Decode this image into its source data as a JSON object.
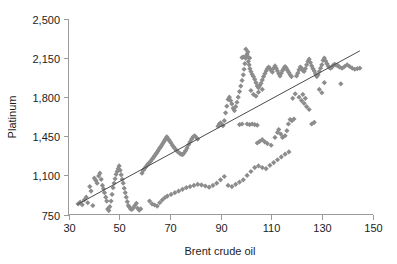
{
  "chart_data": {
    "type": "scatter",
    "title": "",
    "subtitle": "",
    "xlabel": "Brent crude oil",
    "ylabel": "Platinum",
    "xlim": [
      30,
      150
    ],
    "ylim": [
      750,
      2500
    ],
    "xticks": [
      30,
      50,
      70,
      90,
      110,
      130,
      150
    ],
    "xtick_labels": [
      "30",
      "50",
      "70",
      "90",
      "110",
      "130",
      "150"
    ],
    "yticks": [
      750,
      1100,
      1450,
      1800,
      2150,
      2500
    ],
    "ytick_labels": [
      "750",
      "1,100",
      "1,450",
      "1,800",
      "2,150",
      "2,500"
    ],
    "grid": false,
    "legend": null,
    "marker": {
      "shape": "diamond",
      "color": "#8c8c8c",
      "size": 2.6
    },
    "trendline": {
      "type": "linear",
      "color": "#4a4a4a",
      "x_start": 33.5,
      "y_start": 840,
      "x_end": 145,
      "y_end": 2215
    },
    "series": [
      {
        "name": "Platinum vs Brent crude oil",
        "points": [
          [
            33.8,
            845
          ],
          [
            34.6,
            860
          ],
          [
            35.4,
            838
          ],
          [
            36.2,
            880
          ],
          [
            37.0,
            905
          ],
          [
            37.6,
            855
          ],
          [
            38.4,
            1000
          ],
          [
            38.9,
            960
          ],
          [
            39.6,
            830
          ],
          [
            40.2,
            1075
          ],
          [
            40.8,
            1055
          ],
          [
            41.3,
            1030
          ],
          [
            41.9,
            1095
          ],
          [
            42.4,
            1120
          ],
          [
            42.9,
            1065
          ],
          [
            43.4,
            1010
          ],
          [
            43.8,
            980
          ],
          [
            44.2,
            945
          ],
          [
            44.7,
            905
          ],
          [
            45.1,
            870
          ],
          [
            45.5,
            800
          ],
          [
            45.9,
            785
          ],
          [
            46.3,
            820
          ],
          [
            46.8,
            870
          ],
          [
            47.2,
            930
          ],
          [
            47.6,
            990
          ],
          [
            48.0,
            1030
          ],
          [
            48.4,
            1070
          ],
          [
            48.8,
            1110
          ],
          [
            49.2,
            1135
          ],
          [
            49.6,
            1160
          ],
          [
            50.0,
            1185
          ],
          [
            50.4,
            1145
          ],
          [
            50.8,
            1105
          ],
          [
            51.2,
            1065
          ],
          [
            51.6,
            1030
          ],
          [
            52.0,
            985
          ],
          [
            52.4,
            945
          ],
          [
            52.8,
            905
          ],
          [
            53.2,
            865
          ],
          [
            53.6,
            830
          ],
          [
            54.1,
            815
          ],
          [
            54.5,
            800
          ],
          [
            55.0,
            795
          ],
          [
            55.6,
            810
          ],
          [
            56.2,
            830
          ],
          [
            56.8,
            850
          ],
          [
            57.3,
            805
          ],
          [
            57.9,
            790
          ],
          [
            58.5,
            800
          ],
          [
            59.0,
            1120
          ],
          [
            59.5,
            1145
          ],
          [
            60.0,
            1160
          ],
          [
            60.5,
            1175
          ],
          [
            61.0,
            1190
          ],
          [
            61.5,
            1205
          ],
          [
            62.0,
            1215
          ],
          [
            62.5,
            1230
          ],
          [
            63.0,
            1245
          ],
          [
            63.5,
            1260
          ],
          [
            64.0,
            1275
          ],
          [
            64.4,
            1290
          ],
          [
            64.8,
            1300
          ],
          [
            65.2,
            1315
          ],
          [
            65.6,
            1330
          ],
          [
            66.0,
            1345
          ],
          [
            66.4,
            1355
          ],
          [
            66.8,
            1370
          ],
          [
            67.2,
            1385
          ],
          [
            67.6,
            1400
          ],
          [
            68.0,
            1415
          ],
          [
            68.4,
            1430
          ],
          [
            68.8,
            1445
          ],
          [
            69.2,
            1430
          ],
          [
            69.6,
            1420
          ],
          [
            70.0,
            1405
          ],
          [
            70.5,
            1390
          ],
          [
            71.0,
            1370
          ],
          [
            71.5,
            1355
          ],
          [
            72.0,
            1340
          ],
          [
            72.6,
            1325
          ],
          [
            73.2,
            1310
          ],
          [
            73.8,
            1300
          ],
          [
            74.4,
            1290
          ],
          [
            75.0,
            1285
          ],
          [
            75.6,
            1300
          ],
          [
            76.2,
            1320
          ],
          [
            76.8,
            1345
          ],
          [
            77.4,
            1375
          ],
          [
            78.0,
            1400
          ],
          [
            78.6,
            1425
          ],
          [
            79.2,
            1445
          ],
          [
            79.8,
            1455
          ],
          [
            80.4,
            1440
          ],
          [
            81.0,
            1425
          ],
          [
            62.0,
            870
          ],
          [
            63.0,
            845
          ],
          [
            64.0,
            835
          ],
          [
            65.0,
            825
          ],
          [
            66.0,
            855
          ],
          [
            67.0,
            880
          ],
          [
            68.0,
            900
          ],
          [
            69.0,
            915
          ],
          [
            70.5,
            930
          ],
          [
            72.0,
            945
          ],
          [
            73.5,
            960
          ],
          [
            75.0,
            975
          ],
          [
            76.5,
            990
          ],
          [
            78.0,
            1000
          ],
          [
            79.5,
            1010
          ],
          [
            81.0,
            1020
          ],
          [
            82.5,
            1015
          ],
          [
            84.0,
            1005
          ],
          [
            85.5,
            995
          ],
          [
            87.0,
            1010
          ],
          [
            88.5,
            1030
          ],
          [
            90.0,
            1060
          ],
          [
            91.5,
            1090
          ],
          [
            93.0,
            1010
          ],
          [
            94.5,
            1000
          ],
          [
            96.0,
            1020
          ],
          [
            97.5,
            1040
          ],
          [
            99.0,
            1060
          ],
          [
            100.5,
            1100
          ],
          [
            102.0,
            1135
          ],
          [
            103.5,
            1170
          ],
          [
            105.0,
            1185
          ],
          [
            106.5,
            1170
          ],
          [
            108.0,
            1160
          ],
          [
            109.5,
            1190
          ],
          [
            111.0,
            1215
          ],
          [
            112.5,
            1240
          ],
          [
            114.0,
            1265
          ],
          [
            115.5,
            1290
          ],
          [
            117.0,
            1310
          ],
          [
            89.0,
            1540
          ],
          [
            89.5,
            1560
          ],
          [
            90.0,
            1570
          ],
          [
            90.5,
            1555
          ],
          [
            91.0,
            1545
          ],
          [
            91.5,
            1590
          ],
          [
            92.0,
            1660
          ],
          [
            92.5,
            1720
          ],
          [
            93.0,
            1780
          ],
          [
            93.5,
            1800
          ],
          [
            94.0,
            1770
          ],
          [
            94.5,
            1740
          ],
          [
            95.0,
            1700
          ],
          [
            95.5,
            1680
          ],
          [
            96.0,
            1715
          ],
          [
            96.5,
            1755
          ],
          [
            97.0,
            1800
          ],
          [
            97.5,
            1850
          ],
          [
            98.0,
            1900
          ],
          [
            98.5,
            1950
          ],
          [
            99.0,
            2000
          ],
          [
            99.3,
            2050
          ],
          [
            99.6,
            2100
          ],
          [
            99.9,
            2150
          ],
          [
            100.2,
            2170
          ],
          [
            100.5,
            2185
          ],
          [
            100.8,
            2160
          ],
          [
            101.0,
            2120
          ],
          [
            101.3,
            2090
          ],
          [
            101.6,
            2055
          ],
          [
            102.0,
            2030
          ],
          [
            102.5,
            2005
          ],
          [
            103.0,
            1985
          ],
          [
            103.5,
            1960
          ],
          [
            104.0,
            1930
          ],
          [
            104.5,
            1900
          ],
          [
            105.0,
            1885
          ],
          [
            105.5,
            1905
          ],
          [
            106.0,
            1925
          ],
          [
            106.5,
            1955
          ],
          [
            107.0,
            1985
          ],
          [
            107.5,
            2010
          ],
          [
            108.0,
            2035
          ],
          [
            108.5,
            2055
          ],
          [
            109.0,
            2070
          ],
          [
            109.5,
            2055
          ],
          [
            110.0,
            2040
          ],
          [
            110.5,
            2025
          ],
          [
            111.0,
            2060
          ],
          [
            111.5,
            2080
          ],
          [
            112.0,
            2060
          ],
          [
            112.5,
            2035
          ],
          [
            113.0,
            2010
          ],
          [
            113.5,
            1990
          ],
          [
            114.0,
            2015
          ],
          [
            114.5,
            2040
          ],
          [
            115.0,
            2060
          ],
          [
            115.5,
            2075
          ],
          [
            116.0,
            2060
          ],
          [
            116.5,
            2040
          ],
          [
            117.0,
            2020
          ],
          [
            117.5,
            2000
          ],
          [
            118.0,
            1985
          ],
          [
            100.0,
            2230
          ],
          [
            100.8,
            2205
          ],
          [
            98.5,
            2155
          ],
          [
            101.5,
            2150
          ],
          [
            99.0,
            2160
          ],
          [
            102.0,
            1860
          ],
          [
            103.0,
            1825
          ],
          [
            104.0,
            1810
          ],
          [
            105.0,
            1845
          ],
          [
            106.5,
            1870
          ],
          [
            100.5,
            1560
          ],
          [
            101.5,
            1555
          ],
          [
            102.5,
            1560
          ],
          [
            103.5,
            1555
          ],
          [
            104.5,
            1550
          ],
          [
            97.5,
            1555
          ],
          [
            98.5,
            1560
          ],
          [
            104.5,
            1390
          ],
          [
            105.5,
            1405
          ],
          [
            106.5,
            1420
          ],
          [
            107.5,
            1400
          ],
          [
            108.5,
            1385
          ],
          [
            110.0,
            1370
          ],
          [
            111.5,
            1440
          ],
          [
            112.5,
            1485
          ],
          [
            113.0,
            1510
          ],
          [
            113.8,
            1470
          ],
          [
            114.5,
            1440
          ],
          [
            115.5,
            1455
          ],
          [
            116.2,
            1500
          ],
          [
            116.8,
            1560
          ],
          [
            117.5,
            1600
          ],
          [
            118.2,
            1590
          ],
          [
            119.0,
            1605
          ],
          [
            120.0,
            1990
          ],
          [
            120.5,
            2015
          ],
          [
            121.0,
            2045
          ],
          [
            121.5,
            2070
          ],
          [
            122.0,
            2060
          ],
          [
            122.5,
            2040
          ],
          [
            123.0,
            2030
          ],
          [
            123.5,
            2055
          ],
          [
            124.0,
            2090
          ],
          [
            124.5,
            2120
          ],
          [
            125.0,
            2140
          ],
          [
            125.5,
            2110
          ],
          [
            126.0,
            2080
          ],
          [
            126.5,
            2055
          ],
          [
            127.0,
            2035
          ],
          [
            127.5,
            2010
          ],
          [
            128.0,
            1985
          ],
          [
            128.5,
            2000
          ],
          [
            129.0,
            2030
          ],
          [
            129.5,
            2060
          ],
          [
            130.0,
            2090
          ],
          [
            130.5,
            2130
          ],
          [
            131.0,
            2150
          ],
          [
            131.5,
            2125
          ],
          [
            132.0,
            2100
          ],
          [
            132.5,
            2080
          ],
          [
            133.0,
            2065
          ],
          [
            133.5,
            2060
          ],
          [
            134.0,
            2070
          ],
          [
            134.5,
            2085
          ],
          [
            135.0,
            2095
          ],
          [
            135.5,
            2090
          ],
          [
            136.0,
            2085
          ],
          [
            136.5,
            2080
          ],
          [
            137.0,
            2070
          ],
          [
            138.0,
            2060
          ],
          [
            139.0,
            2075
          ],
          [
            140.0,
            2090
          ],
          [
            141.0,
            2075
          ],
          [
            142.0,
            2060
          ],
          [
            143.0,
            2050
          ],
          [
            144.0,
            2055
          ],
          [
            145.0,
            2060
          ],
          [
            121.0,
            1800
          ],
          [
            122.0,
            1770
          ],
          [
            123.0,
            1745
          ],
          [
            124.0,
            1715
          ],
          [
            125.0,
            1690
          ],
          [
            122.5,
            1825
          ],
          [
            123.5,
            1790
          ],
          [
            126.0,
            1560
          ],
          [
            127.0,
            1575
          ],
          [
            129.0,
            1870
          ],
          [
            130.0,
            1840
          ],
          [
            131.0,
            1930
          ],
          [
            137.5,
            1920
          ],
          [
            118.5,
            1790
          ],
          [
            119.5,
            1830
          ]
        ]
      }
    ]
  },
  "axis": {
    "xlabel": "Brent crude oil",
    "ylabel": "Platinum"
  }
}
